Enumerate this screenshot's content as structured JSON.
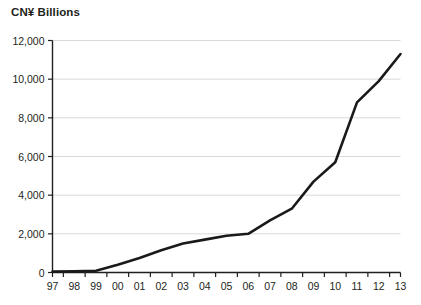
{
  "chart_data": {
    "type": "line",
    "title": "CN¥ Billions",
    "xlabel": "",
    "ylabel": "CN¥ Billions",
    "x": [
      "97",
      "98",
      "99",
      "00",
      "01",
      "02",
      "03",
      "04",
      "05",
      "06",
      "07",
      "08",
      "09",
      "10",
      "11",
      "12",
      "13"
    ],
    "categories": [
      "97",
      "98",
      "99",
      "00",
      "01",
      "02",
      "03",
      "04",
      "05",
      "06",
      "07",
      "08",
      "09",
      "10",
      "11",
      "12",
      "13"
    ],
    "values": [
      50,
      60,
      90,
      400,
      750,
      1150,
      1500,
      1700,
      1900,
      2000,
      2700,
      3300,
      4700,
      5700,
      8800,
      9900,
      11300
    ],
    "series": [
      {
        "name": "CN¥ Billions",
        "values": [
          50,
          60,
          90,
          400,
          750,
          1150,
          1500,
          1700,
          1900,
          2000,
          2700,
          3300,
          4700,
          5700,
          8800,
          9900,
          11300
        ]
      }
    ],
    "ylim": [
      0,
      12000
    ],
    "yticks": [
      0,
      2000,
      4000,
      6000,
      8000,
      10000,
      12000
    ],
    "ytick_labels": [
      "0",
      "2,000",
      "4,000",
      "6,000",
      "8,000",
      "10,000",
      "12,000"
    ],
    "xtick_labels": [
      "97",
      "98",
      "99",
      "00",
      "01",
      "02",
      "03",
      "04",
      "05",
      "06",
      "07",
      "08",
      "09",
      "10",
      "11",
      "12",
      "13"
    ],
    "grid": true,
    "grid_axis": "y",
    "legend": false,
    "legend_position": "none",
    "line_color": "#1a1a1a",
    "grid_color": "#d9d9d9",
    "axis_color": "#231f20",
    "background_color": "#ffffff"
  }
}
